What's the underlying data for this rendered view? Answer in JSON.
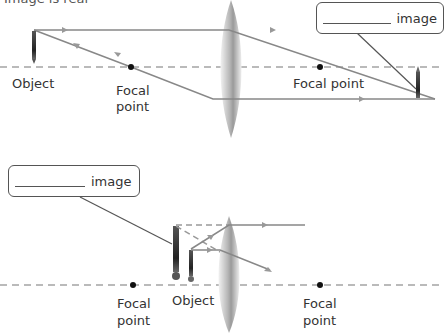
{
  "title_cut": "Image is real",
  "top_diagram": {
    "callout": {
      "blank": "__________",
      "suffix": "image"
    },
    "labels": {
      "object": "Object",
      "focal_left": [
        "Focal",
        "point"
      ],
      "focal_right": "Focal point"
    }
  },
  "bottom_diagram": {
    "callout": {
      "blank": "__________",
      "suffix": "image"
    },
    "labels": {
      "object": "Object",
      "focal_left": [
        "Focal",
        "point"
      ],
      "focal_right": [
        "Focal",
        "point"
      ]
    }
  },
  "colors": {
    "ray": "#888888",
    "axis": "#777777",
    "lens": "#bbbbbb",
    "text": "#333333"
  }
}
